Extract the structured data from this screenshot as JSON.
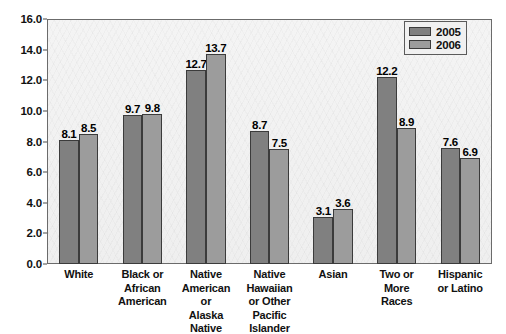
{
  "chart_data": {
    "type": "bar",
    "title": "",
    "xlabel": "",
    "ylabel": "",
    "ylim": [
      0,
      16
    ],
    "ytick_step": 2,
    "grid": false,
    "legend_position": "top-right",
    "categories": [
      "White",
      "Black or African American",
      "Native American or Alaska Native",
      "Native Hawaiian or Other Pacific Islander",
      "Asian",
      "Two or More Races",
      "Hispanic or Latino"
    ],
    "category_lines": [
      [
        "White"
      ],
      [
        "Black or",
        "African",
        "American"
      ],
      [
        "Native",
        "American",
        "or",
        "Alaska Native"
      ],
      [
        "Native",
        "Hawaiian",
        "or Other",
        "Pacific",
        "Islander"
      ],
      [
        "Asian"
      ],
      [
        "Two or",
        "More",
        "Races"
      ],
      [
        "Hispanic",
        "or Latino"
      ]
    ],
    "ytick_labels": [
      "0.0",
      "2.0",
      "4.0",
      "6.0",
      "8.0",
      "10.0",
      "12.0",
      "14.0",
      "16.0"
    ],
    "ytick_values": [
      0,
      2,
      4,
      6,
      8,
      10,
      12,
      14,
      16
    ],
    "series": [
      {
        "name": "2005",
        "color": "#808080",
        "values": [
          8.1,
          9.7,
          12.7,
          8.7,
          3.1,
          12.2,
          7.6
        ],
        "labels": [
          "8.1",
          "9.7",
          "12.7",
          "8.7",
          "3.1",
          "12.2",
          "7.6"
        ]
      },
      {
        "name": "2006",
        "color": "#9c9c9c",
        "values": [
          8.5,
          9.8,
          13.7,
          7.5,
          3.6,
          8.9,
          6.9
        ],
        "labels": [
          "8.5",
          "9.8",
          "13.7",
          "7.5",
          "3.6",
          "8.9",
          "6.9"
        ]
      }
    ]
  },
  "legend": {
    "items": [
      {
        "label": "2005",
        "color": "#808080"
      },
      {
        "label": "2006",
        "color": "#9c9c9c"
      }
    ]
  },
  "colors": {
    "series_2005": "#808080",
    "series_2006": "#9c9c9c",
    "plot_background": "#f2f2f2",
    "axis": "#6b6b6b",
    "text": "#111111"
  }
}
